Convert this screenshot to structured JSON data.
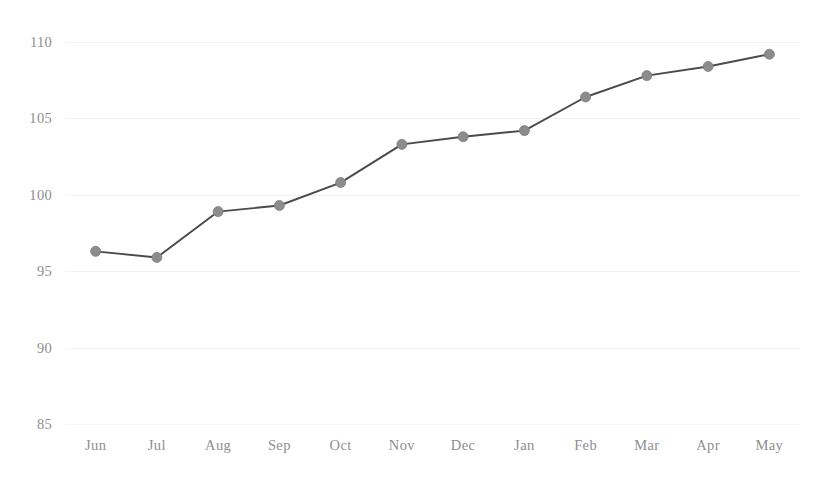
{
  "chart_data": {
    "type": "line",
    "title": "",
    "subtitle": "",
    "xlabel": "",
    "ylabel": "",
    "categories": [
      "Jun",
      "Jul",
      "Aug",
      "Sep",
      "Oct",
      "Nov",
      "Dec",
      "Jan",
      "Feb",
      "Mar",
      "Apr",
      "May"
    ],
    "values": [
      96.3,
      95.9,
      98.9,
      99.3,
      100.8,
      103.3,
      103.8,
      104.2,
      106.4,
      107.8,
      108.4,
      109.2
    ],
    "series": [
      {
        "name": "",
        "values": [
          96.3,
          95.9,
          98.9,
          99.3,
          100.8,
          103.3,
          103.8,
          104.2,
          106.4,
          107.8,
          108.4,
          109.2
        ]
      }
    ],
    "ylim": [
      85,
      110
    ],
    "yticks": [
      85,
      90,
      95,
      100,
      105,
      110
    ],
    "ytick_labels": [
      "85",
      "90",
      "95",
      "100",
      "105",
      "110"
    ],
    "xtick_labels": [
      "Jun",
      "Jul",
      "Aug",
      "Sep",
      "Oct",
      "Nov",
      "Dec",
      "Jan",
      "Feb",
      "Mar",
      "Apr",
      "May"
    ],
    "grid": true,
    "grid_axis": "y",
    "legend": false,
    "legend_position": "none",
    "marker": "circle",
    "colors": {
      "line": "#4a4a4a",
      "marker": "#8c8c8c",
      "grid": "#f2f2f2",
      "tick_label": "#8e8e8e",
      "background": "#ffffff"
    },
    "annotations": []
  }
}
